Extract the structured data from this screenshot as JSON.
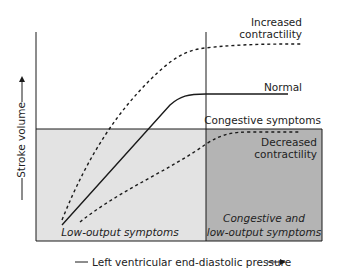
{
  "diagram": {
    "axes": {
      "x_label": "Left ventricular end-diastolic pressure",
      "y_label": "Stroke volume"
    },
    "curves": [
      {
        "name": "Increased contractility",
        "label_line1": "Increased",
        "label_line2": "contractility",
        "style": "dashed"
      },
      {
        "name": "Normal",
        "label": "Normal",
        "style": "solid"
      },
      {
        "name": "Decreased contractility",
        "label_line1": "Decreased",
        "label_line2": "contractility",
        "style": "dashed"
      }
    ],
    "regions": {
      "congestive_threshold_label": "Congestive symptoms",
      "low_output_label": "Low-output symptoms",
      "combined_label_line1": "Congestive and",
      "combined_label_line2": "low-output symptoms"
    },
    "colors": {
      "low_output_fill": "#e3e3e3",
      "combined_fill": "#b4b4b4",
      "line": "#1a1a1a"
    }
  }
}
